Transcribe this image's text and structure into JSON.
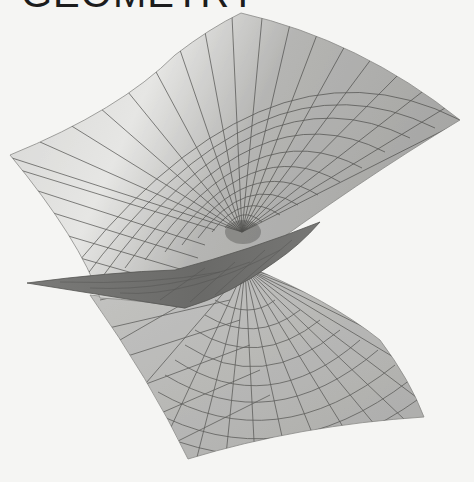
{
  "header": {
    "title": "GEOMETRY"
  },
  "figure": {
    "colors": {
      "background": "#f5f5f3",
      "upper_sheet_light": "#d9d9d7",
      "upper_sheet_dark": "#a9a9a7",
      "underside_band": "#6f6f6d",
      "lower_sheet": "#b2b2b0",
      "grid_line": "#4a4a48"
    }
  }
}
